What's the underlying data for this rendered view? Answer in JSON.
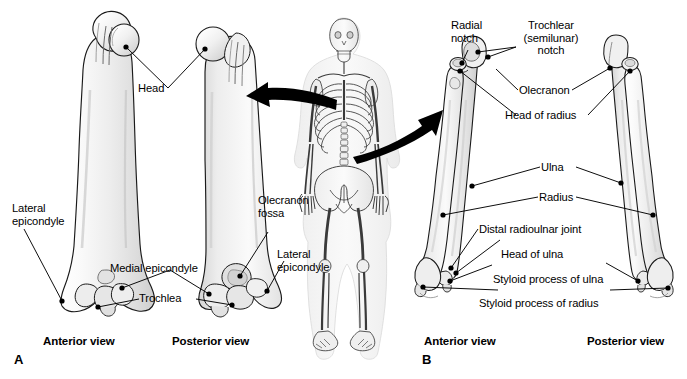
{
  "figure": {
    "background_color": "#ffffff",
    "bone_fill": "#f2f2f2",
    "bone_shade": "#d9d9d9",
    "outline_color": "#000000",
    "leader_color": "#000000",
    "text_color": "#000000"
  },
  "panels": {
    "a": {
      "id": "A",
      "subject": "Humerus",
      "views": [
        {
          "name": "anterior",
          "label": "Anterior view"
        },
        {
          "name": "posterior",
          "label": "Posterior view"
        }
      ],
      "labels": {
        "head": "Head",
        "lateral_epicondyle_left": "Lateral\nepicondyle",
        "medial_epicondyle": "Medial epicondyle",
        "trochlea": "Trochlea",
        "olecranon_fossa": "Olecranon\nfossa",
        "lateral_epicondyle_right": "Lateral\nepicondyle"
      }
    },
    "b": {
      "id": "B",
      "subject": "Radius and ulna",
      "views": [
        {
          "name": "anterior",
          "label": "Anterior view"
        },
        {
          "name": "posterior",
          "label": "Posterior view"
        }
      ],
      "labels": {
        "radial_notch": "Radial\nnotch",
        "trochlear_notch": "Trochlear\n(semilunar)\nnotch",
        "olecranon": "Olecranon",
        "head_of_radius": "Head of radius",
        "ulna": "Ulna",
        "radius": "Radius",
        "distal_radioulnar_joint": "Distal radioulnar joint",
        "head_of_ulna": "Head of ulna",
        "styloid_process_of_ulna": "Styloid process of ulna",
        "styloid_process_of_radius": "Styloid process of radius"
      }
    },
    "skeleton": {
      "name": "Full human skeleton orientation figure",
      "arrows": [
        {
          "name": "arrow-to-humerus",
          "direction": "left",
          "target": "panel A humerus"
        },
        {
          "name": "arrow-to-forearm",
          "direction": "right",
          "target": "panel B radius and ulna"
        }
      ]
    }
  }
}
